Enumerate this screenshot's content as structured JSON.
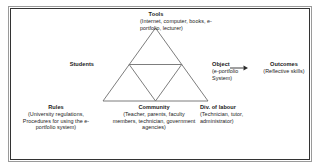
{
  "figure": {
    "background_color": "#ffffff",
    "line_color": "#6e6e6e",
    "text_color": "#1a1a1a",
    "border_color": "#333333"
  },
  "nodes": {
    "tools": {
      "label": "Tools",
      "detail": "(Internet, computer, books, e-portfolio, lecturer)"
    },
    "students": {
      "label": "Students",
      "detail": ""
    },
    "object": {
      "label": "Object",
      "detail": "(e-portfolio System)"
    },
    "outcomes": {
      "label": "Outcomes",
      "detail": "(Reflective skills)"
    },
    "rules": {
      "label": "Rules",
      "detail": "(University regulations, Procedures for using the e-portfolio system)"
    },
    "community": {
      "label": "Community",
      "detail": "(Teacher, parents, faculty members, technician, government agencies)"
    },
    "division_of_labour": {
      "label": "Div. of labour",
      "detail": "(Technician, tutor, administrator)"
    }
  },
  "connector": {
    "from": "object",
    "to": "outcomes",
    "style": "arrow-right"
  }
}
